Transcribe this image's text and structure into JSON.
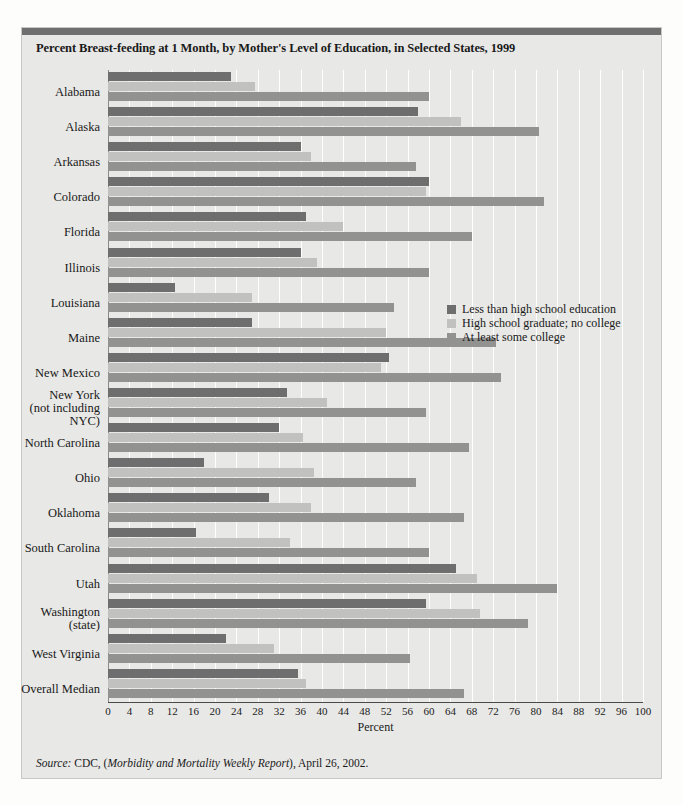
{
  "figure": {
    "title": "Percent Breast-feeding at 1 Month, by Mother's Level of Education, in Selected States, 1999",
    "source_prefix": "Source:",
    "source_rest": " CDC, (",
    "source_italic": "Morbidity and Mortality Weekly Report",
    "source_tail": "), April 26, 2002."
  },
  "legend": {
    "position": "inside-right",
    "items": [
      {
        "label": "Less than high school education",
        "color": "#6e6e6e"
      },
      {
        "label": "High school graduate; no college",
        "color": "#c1c1bf"
      },
      {
        "label": "At least some college",
        "color": "#929290"
      }
    ]
  },
  "chart_data": {
    "type": "bar",
    "orientation": "horizontal",
    "title": "Percent Breast-feeding at 1 Month, by Mother's Level of Education, in Selected States, 1999",
    "xlabel": "Percent",
    "ylabel": "",
    "xlim": [
      0,
      100
    ],
    "xticks": [
      0,
      4,
      8,
      12,
      16,
      20,
      24,
      28,
      32,
      36,
      40,
      44,
      48,
      52,
      56,
      60,
      64,
      68,
      72,
      76,
      80,
      84,
      88,
      92,
      96,
      100
    ],
    "grid": "vertical",
    "categories": [
      "Alabama",
      "Alaska",
      "Arkansas",
      "Colorado",
      "Florida",
      "Illinois",
      "Louisiana",
      "Maine",
      "New Mexico",
      "New York\n(not including\nNYC)",
      "North Carolina",
      "Ohio",
      "Oklahoma",
      "South Carolina",
      "Utah",
      "Washington\n(state)",
      "West Virginia",
      "Overall Median"
    ],
    "series": [
      {
        "name": "Less than high school education",
        "color": "#6e6e6e",
        "values": [
          23,
          58,
          36,
          60,
          37,
          36,
          12.5,
          27,
          52.5,
          33.5,
          32,
          18,
          30,
          16.5,
          65,
          59.5,
          22,
          35.5
        ]
      },
      {
        "name": "High school graduate; no college",
        "color": "#c1c1bf",
        "values": [
          27.5,
          66,
          38,
          59.5,
          44,
          39,
          27,
          52,
          51,
          41,
          36.5,
          38.5,
          38,
          34,
          69,
          69.5,
          31,
          37
        ]
      },
      {
        "name": "At least some college",
        "color": "#929290",
        "values": [
          60,
          80.5,
          57.5,
          81.5,
          68,
          60,
          53.5,
          72.5,
          73.5,
          59.5,
          67.5,
          57.5,
          66.5,
          60,
          84,
          78.5,
          56.5,
          66.5
        ]
      }
    ]
  }
}
